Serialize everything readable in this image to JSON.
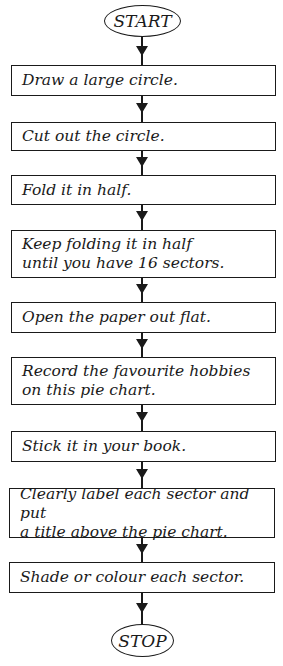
{
  "flowchart": {
    "start": {
      "label": "START"
    },
    "steps": [
      {
        "label": "Draw a large circle."
      },
      {
        "label": "Cut out the circle."
      },
      {
        "label": "Fold it in half."
      },
      {
        "label": "Keep folding it in half\nuntil you have 16 sectors."
      },
      {
        "label": "Open the paper out flat."
      },
      {
        "label": "Record the favourite hobbies\non this pie chart."
      },
      {
        "label": "Stick it in your book."
      },
      {
        "label": "Clearly label each sector and put\na title above the pie chart."
      },
      {
        "label": "Shade or colour each sector."
      }
    ],
    "stop": {
      "label": "STOP"
    }
  }
}
